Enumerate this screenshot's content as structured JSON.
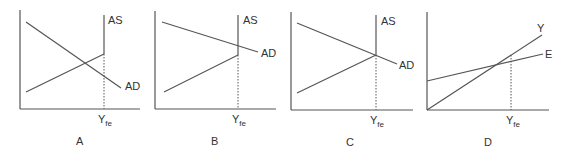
{
  "figure": {
    "panels": [
      {
        "id": "A",
        "letter": "A",
        "x_marker": {
          "main": "Y",
          "sub": "fe"
        },
        "curves": [
          {
            "name": "AS",
            "label": "AS",
            "kind": "supply-kinked"
          },
          {
            "name": "AD",
            "label": "AD",
            "kind": "downward"
          }
        ],
        "description": "AD intersects AS below full employment"
      },
      {
        "id": "B",
        "letter": "B",
        "x_marker": {
          "main": "Y",
          "sub": "fe"
        },
        "curves": [
          {
            "name": "AS",
            "label": "AS",
            "kind": "supply-kinked"
          },
          {
            "name": "AD",
            "label": "AD",
            "kind": "downward"
          }
        ],
        "description": "AD intersects vertical AS above full employment kink"
      },
      {
        "id": "C",
        "letter": "C",
        "x_marker": {
          "main": "Y",
          "sub": "fe"
        },
        "curves": [
          {
            "name": "AS",
            "label": "AS",
            "kind": "supply-kinked"
          },
          {
            "name": "AD",
            "label": "AD",
            "kind": "downward"
          }
        ],
        "description": "AD intersects AS exactly at full employment"
      },
      {
        "id": "D",
        "letter": "D",
        "x_marker": {
          "main": "Y",
          "sub": "fe"
        },
        "curves": [
          {
            "name": "Y",
            "label": "Y",
            "kind": "45-degree"
          },
          {
            "name": "E",
            "label": "E",
            "kind": "expenditure"
          }
        ],
        "description": "Expenditure line E crosses Y line left of full employment"
      }
    ]
  }
}
